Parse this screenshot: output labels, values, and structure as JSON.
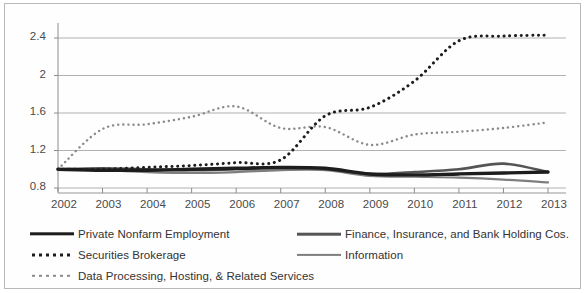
{
  "chart_data": {
    "type": "line",
    "title": "",
    "subtitle": "",
    "xlabel": "",
    "ylabel": "",
    "grid": true,
    "legend_position": "bottom",
    "x": [
      2002,
      2003,
      2004,
      2005,
      2006,
      2007,
      2008,
      2009,
      2010,
      2011,
      2012,
      2013
    ],
    "categories": [
      "2002",
      "2003",
      "2004",
      "2005",
      "2006",
      "2007",
      "2008",
      "2009",
      "2010",
      "2011",
      "2012",
      "2013"
    ],
    "xlim": [
      2002,
      2013
    ],
    "ylim": [
      0.8,
      2.6
    ],
    "yticks": [
      0.8,
      1.2,
      1.6,
      2,
      2.4
    ],
    "ytick_labels": [
      "0.8",
      "1.2",
      "1.6",
      "2",
      "2.4"
    ],
    "series": [
      {
        "name": "Private Nonfarm Employment",
        "style": "solid",
        "width": 3.4,
        "color": "#1d1d1d",
        "values": [
          1.0,
          0.99,
          0.99,
          1.0,
          1.01,
          1.02,
          1.01,
          0.95,
          0.94,
          0.95,
          0.96,
          0.97
        ]
      },
      {
        "name": "Finance, Insurance, and Bank Holding Cos.",
        "style": "solid",
        "width": 2.6,
        "color": "#555555",
        "values": [
          1.0,
          1.01,
          1.0,
          0.99,
          1.0,
          1.01,
          1.0,
          0.95,
          0.97,
          1.0,
          1.06,
          0.97
        ]
      },
      {
        "name": "Information",
        "style": "solid",
        "width": 2.2,
        "color": "#7e7e7e",
        "values": [
          1.0,
          0.99,
          0.97,
          0.96,
          0.97,
          0.99,
          0.99,
          0.93,
          0.92,
          0.91,
          0.89,
          0.86
        ]
      },
      {
        "name": "Securities Brokerage",
        "style": "dotted",
        "width": 3.0,
        "color": "#1d1d1d",
        "values": [
          1.0,
          1.0,
          1.02,
          1.04,
          1.07,
          1.1,
          1.57,
          1.66,
          1.94,
          2.37,
          2.42,
          2.43
        ]
      },
      {
        "name": "Data Processing, Hosting, & Related Services",
        "style": "dotted",
        "width": 2.4,
        "color": "#8a8a8a",
        "values": [
          1.0,
          1.43,
          1.48,
          1.56,
          1.67,
          1.44,
          1.45,
          1.26,
          1.37,
          1.4,
          1.44,
          1.5
        ]
      }
    ]
  },
  "axis": {
    "ytick_labels": [
      "2.4",
      "2",
      "1.6",
      "1.2",
      "0.8"
    ],
    "xtick_labels": [
      "2002",
      "2003",
      "2004",
      "2005",
      "2006",
      "2007",
      "2008",
      "2009",
      "2010",
      "2011",
      "2012",
      "2013"
    ]
  },
  "legend": {
    "items": [
      {
        "label": "Private Nonfarm Employment",
        "swatch": "solid-thick"
      },
      {
        "label": "Finance, Insurance, and Bank Holding Cos.",
        "swatch": "solid-med"
      },
      {
        "label": "Securities Brokerage",
        "swatch": "dot-bold"
      },
      {
        "label": "Information",
        "swatch": "solid-thin"
      },
      {
        "label": "Data Processing, Hosting, & Related Services",
        "swatch": "dot-light"
      }
    ]
  },
  "colors": {
    "grid": "#a9a9a9",
    "axis": "#8c8c8c",
    "frame": "#b9b9b9",
    "text": "#3a3a3a",
    "background": "#ffffff"
  }
}
